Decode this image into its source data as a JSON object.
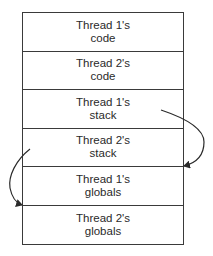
{
  "diagram": {
    "type": "memory-layout",
    "segments": [
      {
        "line1": "Thread 1's",
        "line2": "code"
      },
      {
        "line1": "Thread 2's",
        "line2": "code"
      },
      {
        "line1": "Thread 1's",
        "line2": "stack"
      },
      {
        "line1": "Thread 2's",
        "line2": "stack"
      },
      {
        "line1": "Thread 1's",
        "line2": "globals"
      },
      {
        "line1": "Thread 2's",
        "line2": "globals"
      }
    ],
    "arrows": [
      {
        "from": "Thread 1's stack",
        "to": "Thread 1's globals",
        "side": "right"
      },
      {
        "from": "Thread 2's stack",
        "to": "Thread 2's globals",
        "side": "left"
      }
    ],
    "colors": {
      "line": "#3a3a3a",
      "text": "#2a2a2a",
      "background": "#ffffff"
    }
  }
}
